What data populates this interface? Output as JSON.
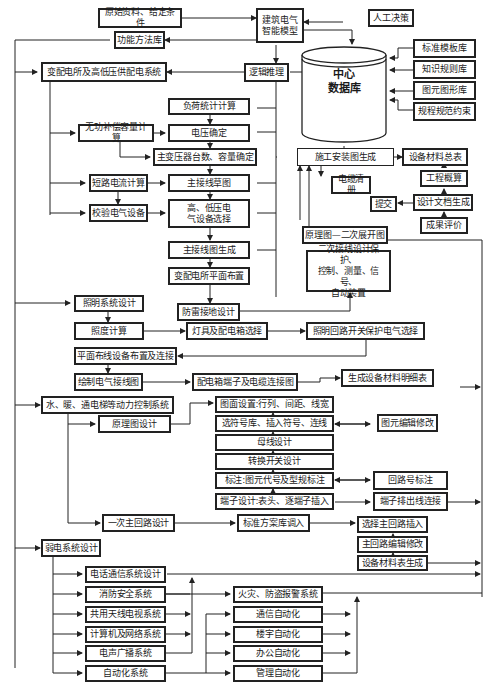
{
  "diagram": {
    "nodes": {
      "source": "原始资料、给定条件",
      "func_lib": "功能方法库",
      "substation": "变配电所及高低压供配电系统",
      "model": "建筑电气\n智能模型",
      "manual": "人工决策",
      "reasoning": "逻辑推理",
      "center_db": "中心\n数据库",
      "std_template": "标准模板库",
      "knowledge": "知识规则库",
      "symbol_lib": "图元图形库",
      "rules": "规程规范约束",
      "load_calc": "负荷统计计算",
      "reactive": "无功补偿容量计算",
      "voltage": "电压确定",
      "transformer": "主变压器台数、容量确定",
      "short_circuit": "短路电流计算",
      "main_draft": "主接线草图",
      "verify": "校验电气设备",
      "hv_lv_select": "高、低压电\n气设备选择",
      "main_gen": "主接线图生成",
      "layout": "变配电所平面布置",
      "lightning": "防雷接地设计",
      "construction": "施工安装图生成",
      "material_total": "设备材料总表",
      "estimate": "工程概算",
      "cable_list": "电缆清册",
      "doc_gen": "设计文档生成",
      "submit": "提交",
      "evaluate": "成果评价",
      "schematic_expand": "原理图—二次展开图",
      "secondary": "二次接线设计保护、\n控制、测量、信号、\n自动装置",
      "lighting": "照明系统设计",
      "illuminance": "照度计算",
      "lamp_box": "灯具及配电箱选择",
      "lighting_switch": "照明回路开关保护电气选择",
      "plane_wiring": "平面布线设备布置及连接",
      "draw_wiring": "绘制电气接线图",
      "box_terminal": "配电箱端子及电缆连接图",
      "material_detail": "生成设备材料明细表",
      "hvac": "水、暖、通电梯等动力控制系统",
      "schematic_design": "原理图设计",
      "sheet_setup": "图面设置:行列、间距、线宽",
      "symbol_select": "选符号库、插入符号、连线",
      "symbol_edit": "图元编辑修改",
      "busbar": "母线设计",
      "switch_design": "转换开关设计",
      "annotate": "标注:图元代号及型规标注",
      "circuit_no": "回路号标注",
      "terminal_design": "端子设计:表头、逐端子插入",
      "terminal_out": "端子排出线连接",
      "primary_circuit": "一次主回路设计",
      "std_scheme": "标准方案库调入",
      "select_main": "选择主回路插入",
      "main_edit": "主回路编辑修改",
      "material_gen": "设备材料表生成",
      "weak_current": "弱电系统设计",
      "telephone": "电话通信系统设计",
      "fire": "消防安全系统",
      "catv": "共用天线电视系统",
      "computer": "计算机及网络系统",
      "broadcast": "电声广播系统",
      "automation": "自动化系统",
      "fire_alarm": "火灾、防盗报警系统",
      "comm_auto": "通信自动化",
      "building_auto": "楼宇自动化",
      "office_auto": "办公自动化",
      "mgmt_auto": "管理自动化"
    }
  }
}
